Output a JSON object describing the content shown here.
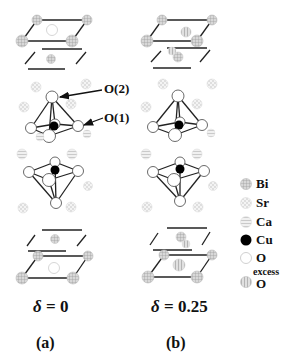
{
  "diagram": {
    "annotations": {
      "o2": "O(2)",
      "o1": "O(1)"
    },
    "panels": [
      {
        "label": "(a)",
        "delta_symbol": "δ",
        "delta_eq": " = 0"
      },
      {
        "label": "(b)",
        "delta_symbol": "δ",
        "delta_eq": " = 0.25"
      }
    ],
    "legend": [
      {
        "atom": "Bi",
        "style": "grid-gray",
        "color": "#bbbbbb"
      },
      {
        "atom": "Sr",
        "style": "dotted-light",
        "color": "#dddddd"
      },
      {
        "atom": "Ca",
        "style": "striped-light",
        "color": "#cccccc"
      },
      {
        "atom": "Cu",
        "style": "solid-black",
        "color": "#000000"
      },
      {
        "atom": "O",
        "style": "open-white",
        "color": "#ffffff"
      },
      {
        "atom": "O",
        "prefix": "excess",
        "style": "hatched-gray",
        "color": "#c8c8c8"
      }
    ]
  }
}
